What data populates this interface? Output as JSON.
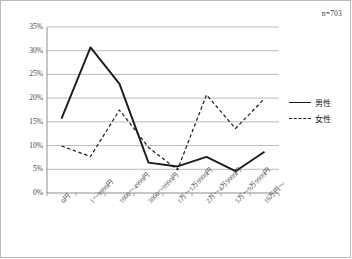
{
  "annotation": {
    "sample_size": "n=703"
  },
  "legend": {
    "position": "right",
    "items": [
      {
        "label": "男性",
        "style": "solid",
        "icon": "solid-line-icon"
      },
      {
        "label": "女性",
        "style": "dashed",
        "icon": "dashed-line-icon"
      }
    ]
  },
  "axes": {
    "y_ticks": [
      "0%",
      "5%",
      "10%",
      "15%",
      "20%",
      "25%",
      "30%",
      "35%"
    ],
    "x_ticks": [
      "0円",
      "1〜9999円",
      "1000〜4999円",
      "5000〜9999円",
      "1万〜1万9999円",
      "2万〜4万9999円",
      "5万〜9万9999円",
      "10万円〜"
    ]
  },
  "chart_data": {
    "type": "line",
    "title": "",
    "xlabel": "",
    "ylabel": "",
    "ylim": [
      0,
      35
    ],
    "grid": true,
    "legend_position": "right",
    "annotation": "n=703",
    "categories": [
      "0円",
      "1〜9999円",
      "1000〜4999円",
      "5000〜9999円",
      "1万〜1万9999円",
      "2万〜4万9999円",
      "5万〜9万9999円",
      "10万円〜"
    ],
    "series": [
      {
        "name": "男性",
        "style": "solid",
        "color": "#1b1b1b",
        "values": [
          15.7,
          30.7,
          23.0,
          6.4,
          5.6,
          7.6,
          4.6,
          8.7
        ]
      },
      {
        "name": "女性",
        "style": "dashed",
        "color": "#1b1b1b",
        "values": [
          9.9,
          7.7,
          17.5,
          9.6,
          4.9,
          20.7,
          13.6,
          19.9
        ]
      }
    ]
  }
}
